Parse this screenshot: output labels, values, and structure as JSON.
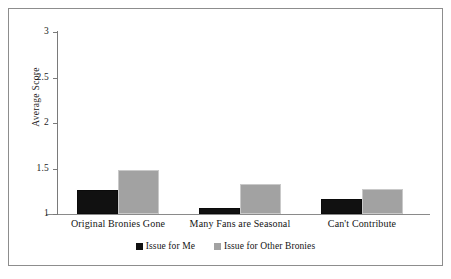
{
  "chart_data": {
    "type": "bar",
    "title": "",
    "subtitle": "",
    "xlabel": "",
    "ylabel": "Average Score",
    "categories": [
      "Original Bronies Gone",
      "Many Fans are Seasonal",
      "Can't Contribute"
    ],
    "series": [
      {
        "name": "Issue for Me",
        "color": "#111111",
        "values": [
          1.26,
          1.07,
          1.17
        ]
      },
      {
        "name": "Issue for Other Bronies",
        "color": "#a2a2a2",
        "values": [
          1.48,
          1.33,
          1.28
        ]
      }
    ],
    "ylim": [
      1,
      3
    ],
    "yticks": [
      1,
      1.5,
      2,
      2.5,
      3
    ],
    "ytick_labels": [
      "1",
      "1.5",
      "2",
      "2.5",
      "3"
    ],
    "grid": false,
    "legend_position": "bottom",
    "annotations": []
  },
  "figure": {
    "frame_color": "#8d8d8d",
    "axis_color": "#7a7a7a",
    "background": "#ffffff"
  }
}
